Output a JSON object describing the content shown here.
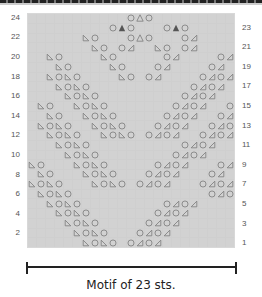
{
  "chart": {
    "columns": 23,
    "rows_count": 24,
    "left_row_labels": [
      "24",
      "22",
      "20",
      "18",
      "16",
      "14",
      "12",
      "10",
      "8",
      "6",
      "4",
      "2"
    ],
    "right_row_labels": [
      "23",
      "21",
      "19",
      "17",
      "15",
      "13",
      "11",
      "9",
      "7",
      "5",
      "3",
      "1"
    ],
    "legend_symbols": {
      "L": "left-slant-decrease",
      "O": "yarn-over",
      "R": "right-slant-decrease",
      "A": "filled-triangle-double-decrease",
      "a": "outlined-triangle-double-decrease"
    },
    "grid_rows_top_to_bottom": [
      "...........OaO.........",
      ".........OAO...OAO.....",
      "......LO...OaO...OR....",
      ".......LO.OR..LO.OR....",
      "..LO....LO.....OR....OR",
      "...LO....LO...OR....OR.",
      "..LOLO....LO.OR....OROR",
      "...LOLO...........OROR.",
      "....LOLO.........OROR..",
      ".LO..LOLO.......OROR..O",
      "..LO..LOLO.....OROR..OR",
      ".LOLO..LOLO...OROR..ORO",
      "..LOLO..LOLO.OROR..OROR",
      "...LOLO..........OROR..",
      "....LOLO........OROR...",
      "LO...LOLO.....OROR...OR",
      ".LO...LOLO...OROR...OR.",
      "LOLO...LOLO.OROR...OROR",
      ".LOLO...............OROR",
      "..LOLO.........OROR.....",
      "...LOLO.......OROR......",
      "....LOLO.....OROR.......",
      ".....LOLO...OROR........",
      "......LOLO.OROR........."
    ]
  },
  "caption": "Motif of 23 sts.",
  "colors": {
    "grid_bg": "#d2d2d2",
    "symbol": "#7a7a7a",
    "filled": "#555555"
  }
}
